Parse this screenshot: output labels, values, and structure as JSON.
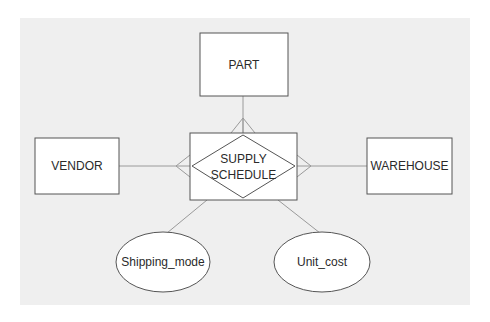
{
  "diagram": {
    "type": "entity-relationship",
    "background_color": "#efefef",
    "stroke_color": "#555555",
    "connector_color": "#9a9a9a",
    "entities": [
      {
        "id": "part",
        "label": "PART"
      },
      {
        "id": "vendor",
        "label": "VENDOR"
      },
      {
        "id": "warehouse",
        "label": "WAREHOUSE"
      }
    ],
    "relationship": {
      "id": "supply_schedule",
      "label_line1": "SUPPLY",
      "label_line2": "SCHEDULE",
      "kind": "associative entity"
    },
    "attributes": [
      {
        "id": "shipping_mode",
        "label": "Shipping_mode"
      },
      {
        "id": "unit_cost",
        "label": "Unit_cost"
      }
    ],
    "connections": [
      {
        "from": "part",
        "to": "supply_schedule",
        "cardinality_at_relationship": "many"
      },
      {
        "from": "vendor",
        "to": "supply_schedule",
        "cardinality_at_relationship": "many"
      },
      {
        "from": "warehouse",
        "to": "supply_schedule",
        "cardinality_at_relationship": "many"
      },
      {
        "from": "supply_schedule",
        "to": "shipping_mode"
      },
      {
        "from": "supply_schedule",
        "to": "unit_cost"
      }
    ]
  }
}
